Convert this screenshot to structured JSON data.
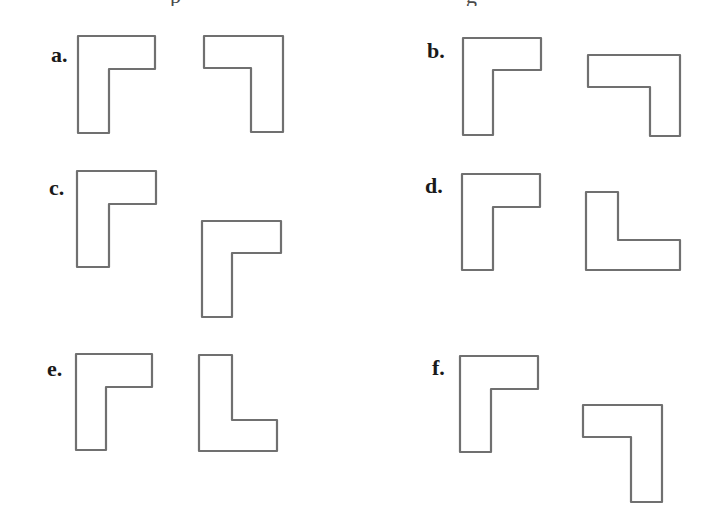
{
  "figure": {
    "stroke_color": "#707070",
    "label_color": "#1a1a1a",
    "cutoff_caption": {
      "fragments": [
        {
          "char": "p",
          "x": 170
        },
        {
          "char": "g",
          "x": 466
        }
      ]
    },
    "options": [
      {
        "label": "a.",
        "label_pos": [
          51,
          44
        ],
        "shapes": [
          {
            "name": "reference-l-shape",
            "points": "78,36 155,36 155,69 109,69 109,133 78,133"
          },
          {
            "name": "comparison-shape",
            "points": "204,36 283,36 283,132 251,132 251,68 204,68"
          }
        ]
      },
      {
        "label": "b.",
        "label_pos": [
          427,
          40
        ],
        "shapes": [
          {
            "name": "reference-l-shape",
            "points": "463,38 541,38 541,70 493,70 493,135 463,135"
          },
          {
            "name": "comparison-shape",
            "points": "588,55 680,55 680,136 650,136 650,87 588,87"
          }
        ]
      },
      {
        "label": "c.",
        "label_pos": [
          49,
          177
        ],
        "shapes": [
          {
            "name": "reference-l-shape",
            "points": "77,171 156,171 156,204 109,204 109,267 77,267"
          },
          {
            "name": "comparison-shape",
            "points": "202,221 281,221 281,253 232,253 232,317 202,317"
          }
        ]
      },
      {
        "label": "d.",
        "label_pos": [
          425,
          175
        ],
        "shapes": [
          {
            "name": "reference-l-shape",
            "points": "462,174 540,174 540,207 493,207 493,270 462,270"
          },
          {
            "name": "comparison-shape",
            "points": "586,192 618,192 618,240 680,240 680,270 586,270"
          }
        ]
      },
      {
        "label": "e.",
        "label_pos": [
          47,
          358
        ],
        "shapes": [
          {
            "name": "reference-l-shape",
            "points": "76,354 152,354 152,387 106,387 106,450 76,450"
          },
          {
            "name": "comparison-shape",
            "points": "199,355 232,355 232,420 277,420 277,451 199,451"
          }
        ]
      },
      {
        "label": "f.",
        "label_pos": [
          432,
          357
        ],
        "shapes": [
          {
            "name": "reference-l-shape",
            "points": "460,356 538,356 538,389 491,389 491,452 460,452"
          },
          {
            "name": "comparison-shape",
            "points": "583,405 662,405 662,502 631,502 631,437 583,437"
          }
        ]
      }
    ]
  }
}
